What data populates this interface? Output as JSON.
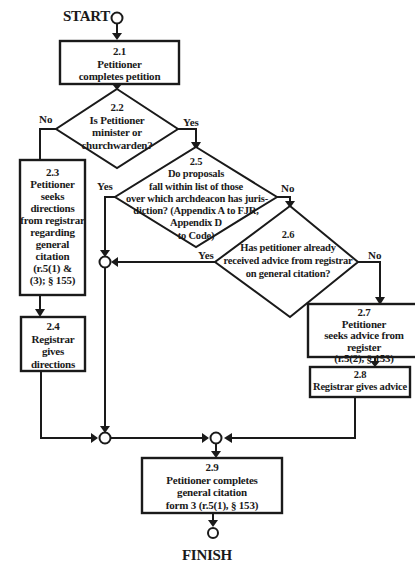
{
  "start_label": "START",
  "finish_label": "FINISH",
  "nodes": {
    "n21": {
      "id": "2.1",
      "lines": [
        "Petitioner",
        "completes petition"
      ]
    },
    "n22": {
      "id": "2.2",
      "lines": [
        "Is Petitioner",
        "minister or",
        "churchwarden?"
      ]
    },
    "n23": {
      "id": "2.3",
      "lines": [
        "Petitioner",
        "seeks",
        "directions",
        "from registrar",
        "regarding",
        "general",
        "citation",
        "(r.5(1) &",
        "(3); § 155)"
      ]
    },
    "n24": {
      "id": "2.4",
      "lines": [
        "Registrar",
        "gives",
        "directions"
      ]
    },
    "n25": {
      "id": "2.5",
      "lines": [
        "Do proposals",
        "fall within list of those",
        "over which archdeacon has juris-",
        "diction? (Appendix A to FJR,",
        "Appendix D",
        "to Code)"
      ]
    },
    "n26": {
      "id": "2.6",
      "lines": [
        "Has petitioner already",
        "received advice from registrar",
        "on general citation?"
      ]
    },
    "n27": {
      "id": "2.7",
      "lines": [
        "Petitioner",
        "seeks advice from",
        "register",
        "(r.5(2), § 153)"
      ]
    },
    "n28": {
      "id": "2.8",
      "lines": [
        "Registrar gives advice"
      ]
    },
    "n29": {
      "id": "2.9",
      "lines": [
        "Petitioner completes",
        "general citation",
        "form 3 (r.5(1), § 153)"
      ]
    }
  },
  "edge_labels": {
    "n22_no": "No",
    "n22_yes": "Yes",
    "n25_yes": "Yes",
    "n25_no": "No",
    "n26_yes": "Yes",
    "n26_no": "No"
  }
}
